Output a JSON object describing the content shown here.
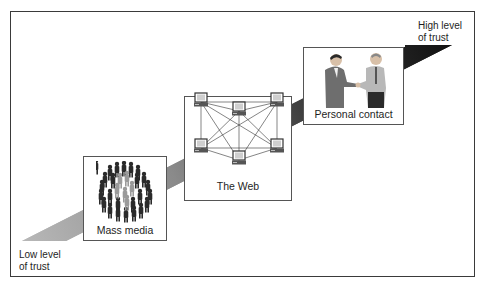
{
  "diagram": {
    "type": "trust-continuum",
    "axis": {
      "low_label_line1": "Low level",
      "low_label_line2": "of trust",
      "high_label_line1": "High level",
      "high_label_line2": "of trust",
      "gradient_start_color": "#b8b8b8",
      "gradient_end_color": "#111111"
    },
    "stages": [
      {
        "label": "Mass media",
        "icon": "crowd-icon",
        "order": 1
      },
      {
        "label": "The Web",
        "icon": "network-computers-icon",
        "order": 2
      },
      {
        "label": "Personal contact",
        "icon": "handshake-icon",
        "order": 3
      }
    ]
  }
}
